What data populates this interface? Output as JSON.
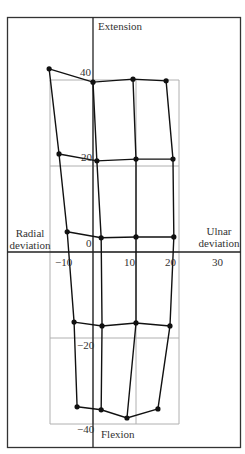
{
  "chart_data": {
    "type": "line",
    "title": "",
    "xlabel": "Radial deviation / Ulnar deviation",
    "ylabel": "Extension / Flexion",
    "axis_labels": {
      "top": "Extension",
      "bottom": "Flexion",
      "left_line1": "Radial",
      "left_line2": "deviation",
      "right_line1": "Ulnar",
      "right_line2": "deviation"
    },
    "x_ticks": [
      {
        "value": -10,
        "label": "-10"
      },
      {
        "value": 10,
        "label": "10"
      },
      {
        "value": 20,
        "label": "20"
      },
      {
        "value": 30,
        "label": "30"
      }
    ],
    "y_ticks": [
      {
        "value": 40,
        "label": "40"
      },
      {
        "value": 20,
        "label": "20"
      },
      {
        "value": 0,
        "label": "0"
      },
      {
        "value": -20,
        "label": "-20"
      },
      {
        "value": -40,
        "label": "-40"
      }
    ],
    "xlim": [
      -20,
      34
    ],
    "ylim": [
      -46,
      55
    ],
    "grid": {
      "x": [
        -10,
        0,
        10,
        20
      ],
      "y": [
        40,
        20,
        0,
        -20,
        -40
      ],
      "color": "#b0b0b0"
    },
    "legend": null,
    "rows": [
      {
        "name": "row-1",
        "points": [
          [
            -10.2,
            42.6
          ],
          [
            0.0,
            39.5
          ],
          [
            9.3,
            40.2
          ],
          [
            17.0,
            39.8
          ]
        ]
      },
      {
        "name": "row-2",
        "points": [
          [
            -7.9,
            22.8
          ],
          [
            0.9,
            21.2
          ],
          [
            10.0,
            21.6
          ],
          [
            18.6,
            21.6
          ]
        ]
      },
      {
        "name": "row-3",
        "points": [
          [
            -6.0,
            4.7
          ],
          [
            1.9,
            3.3
          ],
          [
            10.0,
            3.5
          ],
          [
            18.8,
            3.5
          ]
        ]
      },
      {
        "name": "row-4",
        "points": [
          [
            -4.4,
            -16.3
          ],
          [
            2.1,
            -17.2
          ],
          [
            10.0,
            -16.5
          ],
          [
            17.9,
            -17.2
          ]
        ]
      },
      {
        "name": "row-5",
        "points": [
          [
            -3.7,
            -36.0
          ],
          [
            1.9,
            -36.7
          ],
          [
            7.9,
            -38.6
          ],
          [
            15.1,
            -36.5
          ]
        ]
      }
    ],
    "colors": {
      "line": "#111111",
      "point": "#111111",
      "axis": "#222222",
      "grid": "#b0b0b0",
      "frame": "#333333"
    }
  }
}
